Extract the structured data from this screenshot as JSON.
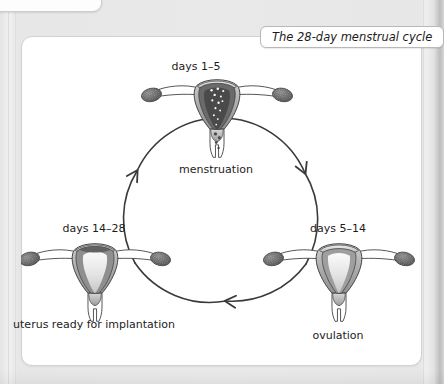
{
  "title_pill": {
    "text": "The 28-day menstrual cycle"
  },
  "diagram": {
    "type": "cycle-diagram",
    "flow_direction": "clockwise",
    "stages": [
      {
        "id": "menstruation",
        "position": "top",
        "days_label": "days 1–5",
        "caption": "menstruation"
      },
      {
        "id": "ovulation",
        "position": "right",
        "days_label": "days 5–14",
        "caption": "ovulation"
      },
      {
        "id": "implantation",
        "position": "left",
        "days_label": "days 14–28",
        "caption": "uterus ready for implantation"
      }
    ],
    "arrow_count": 3,
    "colors": {
      "panel_background": "#ffffff",
      "page_background": "#e9e9e9",
      "outline": "#3a3a3a",
      "text": "#1c1c1c",
      "tissue_light": "#f2f2f2",
      "tissue_mid": "#b9b9b9",
      "tissue_dark": "#6e6e6e",
      "lining_dark": "#4a4a4a",
      "ovary": "#5a5a5a"
    }
  }
}
